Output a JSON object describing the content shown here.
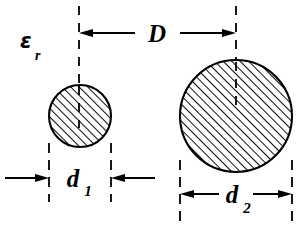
{
  "figure": {
    "type": "engineering-dimension-diagram",
    "background_color": "#ffffff",
    "line_color": "#000000"
  },
  "labels": {
    "permittivity_symbol": "ε",
    "permittivity_subscript": "r",
    "separation_symbol": "D",
    "small_diameter_symbol": "d",
    "small_diameter_subscript": "1",
    "large_diameter_symbol": "d",
    "large_diameter_subscript": "2"
  },
  "icons": {
    "arrow_left": "arrow-left-icon",
    "arrow_right": "arrow-right-icon",
    "hatch": "hatch-fill-icon",
    "centerline": "centerline-icon"
  },
  "geometry": {
    "small_circle": {
      "center_x": 80,
      "center_y": 116,
      "radius": 31,
      "diameter": 62,
      "fill": "hatched-45"
    },
    "large_circle": {
      "center_x": 236,
      "center_y": 116,
      "radius": 56,
      "diameter": 112,
      "fill": "hatched-45"
    },
    "separation_dimension": {
      "label": "D",
      "from_x": 79,
      "to_x": 236,
      "line_y": 33,
      "arrows": "both-inward-ends"
    },
    "small_diameter_dimension": {
      "label": "d1",
      "from_x": 49,
      "to_x": 111,
      "line_y": 178,
      "arrows": "outside-pointing-in"
    },
    "large_diameter_dimension": {
      "label": "d2",
      "from_x": 180,
      "to_x": 292,
      "line_y": 194,
      "arrows": "inside-pointing-out"
    },
    "hatch_angle_degrees": 45,
    "hatch_spacing_px": 6
  }
}
